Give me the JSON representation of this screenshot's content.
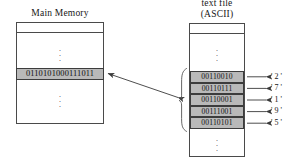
{
  "diagram": {
    "title_left": "Main Memory",
    "title_right_line1": "text file",
    "title_right_line2": "(ASCII)",
    "memory_word": "0110101000111011",
    "ellipsis_glyph": ".",
    "bytes": [
      {
        "bits": "00110010",
        "char": "' 2 '"
      },
      {
        "bits": "00110111",
        "char": "' 7 '"
      },
      {
        "bits": "00110001",
        "char": "' 1 '"
      },
      {
        "bits": "00111001",
        "char": "' 9 '"
      },
      {
        "bits": "00110101",
        "char": "' 5 '"
      }
    ],
    "colors": {
      "page_background": "#ffffff",
      "cell_fill": "#b9b9b9",
      "box_stroke": "#4a4a4a",
      "cell_stroke": "#3c3c3c",
      "arrow_stroke": "#3a3a3a",
      "text": "#171717"
    }
  }
}
